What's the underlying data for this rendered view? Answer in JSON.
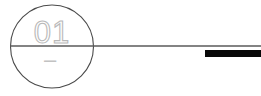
{
  "drawing": {
    "title": "balloon-callout-with-leader-line",
    "background_color": "#ffffff",
    "canvas": {
      "width": 261,
      "height": 96
    },
    "balloon": {
      "name": "circle-balloon",
      "label": "01",
      "sublabel": "–",
      "center_x": 52,
      "center_y": 46.5,
      "radius": 41.5,
      "stroke_color": "#4a4a4a",
      "stroke_width": 1.1,
      "fill": "none",
      "label_color": "#b9b9b9",
      "sublabel_color": "#c2c2c2"
    },
    "leader_line": {
      "name": "horizontal-leader-line",
      "x1": 11,
      "x2": 261,
      "y": 46,
      "stroke_color": "#5a5a5a",
      "stroke_width": 1.2
    },
    "bar": {
      "name": "solid-black-bar",
      "x": 205,
      "y": 50,
      "width": 56,
      "height": 7,
      "fill_color": "#080808"
    }
  }
}
